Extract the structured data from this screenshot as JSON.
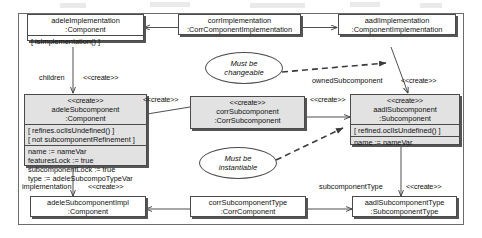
{
  "diagram": {
    "colors": {
      "line": "#4a4a4a",
      "node_fill": "#ffffff",
      "node_fill_gray": "#e2e2e2",
      "text": "#101010",
      "frame": "#6b6b6b"
    },
    "stereotype_create": "<<create>>",
    "nodes": [
      {
        "id": "adeleImplementation",
        "name": "adeleImplementation",
        "type": ":Component",
        "stereotype": "",
        "constraints": [
          "[ isImplementation() ]"
        ],
        "attributes": []
      },
      {
        "id": "corrImplementation",
        "name": "corrImplementation",
        "type": ":CorrComponentImplementation",
        "stereotype": "",
        "constraints": [],
        "attributes": []
      },
      {
        "id": "aadlImplementation",
        "name": "aadlImplementation",
        "type": ":ComponentImplementation",
        "stereotype": "",
        "constraints": [],
        "attributes": []
      },
      {
        "id": "adeleSubcomponent",
        "name": "adeleSubcomponent",
        "type": ":Component",
        "stereotype": "<<create>>",
        "constraints": [
          "[ refines.oclIsUndefined() ]",
          "[ not subcomponentRefinement ]"
        ],
        "attributes": [
          "name := nameVar",
          "featuresLock := true",
          "subcomponentLock := true",
          "type := adeleSubcompoTypeVar"
        ]
      },
      {
        "id": "corrSubcomponent",
        "name": "corrSubcomponent",
        "type": ":CorrSubcomponent",
        "stereotype": "<<create>>",
        "constraints": [],
        "attributes": []
      },
      {
        "id": "aadlSubcomponent",
        "name": "aadlSubcomponent",
        "type": ":Subcomponent",
        "stereotype": "<<create>>",
        "constraints": [
          "[ refined.oclIsUndefined() ]"
        ],
        "attributes": [
          "name := nameVar"
        ]
      },
      {
        "id": "adeleSubcomponentImpl",
        "name": "adeleSubcomponentImpl",
        "type": ":Component",
        "stereotype": "",
        "constraints": [],
        "attributes": []
      },
      {
        "id": "corrSubcomponentType",
        "name": "corrSubcomponentType",
        "type": ":CorrComponent",
        "stereotype": "",
        "constraints": [],
        "attributes": []
      },
      {
        "id": "aadlSubcomponentType",
        "name": "aadlSubcomponentType",
        "type": ":SubcomponentType",
        "stereotype": "",
        "constraints": [],
        "attributes": []
      }
    ],
    "notes": [
      {
        "id": "note-changeable",
        "line1": "Must be",
        "line2": "changeable"
      },
      {
        "id": "note-instantiable",
        "line1": "Must be",
        "line2": "instantiable"
      }
    ],
    "edge_labels": [
      {
        "id": "children-label",
        "text": "children"
      },
      {
        "id": "children-stereotype",
        "text": "<<create>>"
      },
      {
        "id": "corr-to-adele-sub-stereotype",
        "text": "<<create>>"
      },
      {
        "id": "corr-to-aadl-sub-stereotype",
        "text": "<<create>>"
      },
      {
        "id": "owned-subcomponent-label",
        "text": "ownedSubcomponent"
      },
      {
        "id": "owned-subcomponent-stereotype",
        "text": "<<create>>"
      },
      {
        "id": "implementation-label",
        "text": "implementation"
      },
      {
        "id": "implementation-stereotype",
        "text": "<<create>>"
      },
      {
        "id": "subcomponent-type-label",
        "text": "subcomponentType"
      },
      {
        "id": "subcomponent-type-stereotype",
        "text": "<<create>>"
      }
    ]
  }
}
